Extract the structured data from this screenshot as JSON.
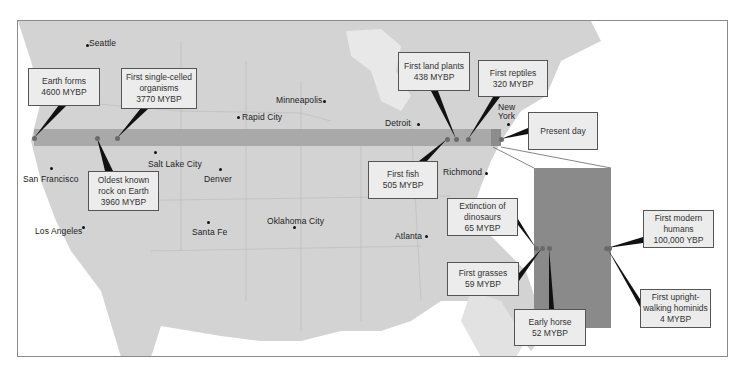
{
  "diagram": {
    "colors": {
      "land": "#d3d3d3",
      "ocean": "#ffffff",
      "timeline_bar": "#a9a9a9",
      "recent_segment": "#8c8c8c",
      "magnified_panel": "#8a8a8a",
      "callout_box": "#ececec"
    }
  },
  "cities": [
    {
      "name": "Seattle"
    },
    {
      "name": "Minneapolis"
    },
    {
      "name": "Rapid City"
    },
    {
      "name": "Detroit"
    },
    {
      "name": "New York"
    },
    {
      "name": "Salt Lake City"
    },
    {
      "name": "San Francisco"
    },
    {
      "name": "Denver"
    },
    {
      "name": "Richmond"
    },
    {
      "name": "Los Angeles"
    },
    {
      "name": "Santa Fe"
    },
    {
      "name": "Oklahoma City"
    },
    {
      "name": "Atlanta"
    }
  ],
  "events": [
    {
      "label": "Earth forms",
      "time": "4600 MYBP"
    },
    {
      "label": "First single-celled organisms",
      "line1": "First single-celled",
      "line2": "organisms",
      "time": "3770 MYBP"
    },
    {
      "label": "Oldest known rock on Earth",
      "line1": "Oldest known",
      "line2": "rock on Earth",
      "time": "3960 MYBP"
    },
    {
      "label": "First land plants",
      "time": "438 MYBP"
    },
    {
      "label": "First reptiles",
      "time": "320 MYBP"
    },
    {
      "label": "First fish",
      "time": "505 MYBP"
    },
    {
      "label": "Present day"
    },
    {
      "label": "Extinction of dinosaurs",
      "line1": "Extinction of",
      "line2": "dinosaurs",
      "time": "65 MYBP"
    },
    {
      "label": "First grasses",
      "time": "59 MYBP"
    },
    {
      "label": "Early horse",
      "time": "52 MYBP"
    },
    {
      "label": "First modern humans",
      "line1": "First modern",
      "line2": "humans",
      "time": "100,000 YBP"
    },
    {
      "label": "First upright-walking hominids",
      "line1": "First upright-",
      "line2": "walking hominids",
      "time": "4 MYBP"
    }
  ]
}
